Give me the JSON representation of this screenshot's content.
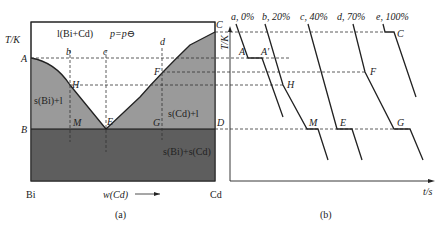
{
  "panel_a": {
    "caption": "(a)",
    "y_axis_label": "T/K",
    "x_axis_label": "w(Cd)",
    "left_component": "Bi",
    "right_component": "Cd",
    "pressure_label": "p=p⊖",
    "regions": {
      "liquid": "l(Bi+Cd)",
      "bi_liquid": "s(Bi)+l",
      "cd_liquid": "s(Cd)+l",
      "solid": "s(Bi)+s(Cd)"
    },
    "points": {
      "A": "A",
      "B": "B",
      "C": "C",
      "D": "D",
      "E": "E",
      "F": "F",
      "G": "G",
      "H": "H",
      "M": "M",
      "b": "b",
      "c": "c",
      "d": "d"
    },
    "colors": {
      "liquid": "#ffffff",
      "two_phase": "#9a9a9a",
      "solid": "#5e5e5e",
      "line": "#222222"
    }
  },
  "panel_b": {
    "caption": "(b)",
    "y_axis_label": "T/K",
    "x_axis_label": "t/s",
    "curves": [
      {
        "id": "a",
        "label": "a, 0%"
      },
      {
        "id": "b",
        "label": "b, 20%"
      },
      {
        "id": "c",
        "label": "c, 40%"
      },
      {
        "id": "d",
        "label": "d, 70%"
      },
      {
        "id": "e",
        "label": "e, 100%"
      }
    ],
    "points": {
      "C": "C",
      "A": "A",
      "A_prime": "A′",
      "F": "F",
      "H": "H",
      "D": "D",
      "M": "M",
      "E": "E",
      "G": "G"
    }
  }
}
